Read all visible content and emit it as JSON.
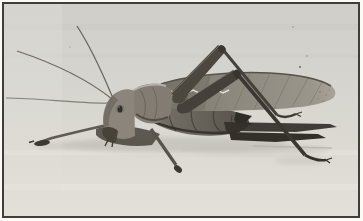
{
  "figure": {
    "type": "black-and-white photograph",
    "orientation": "facing-left",
    "colors": {
      "page_margin": "#fbfaf6",
      "frame_border": "#413e3a",
      "photo_background_top": "#d0cec9",
      "photo_background_bottom": "#e3e0d9",
      "insect_body": "#6e6961",
      "insect_dark": "#332f29",
      "insect_light": "#b6b0a6",
      "wing_gray": "#8d887e",
      "wing_speckle": "#ece9e1",
      "ground_shadow": "#bdbab3"
    }
  }
}
